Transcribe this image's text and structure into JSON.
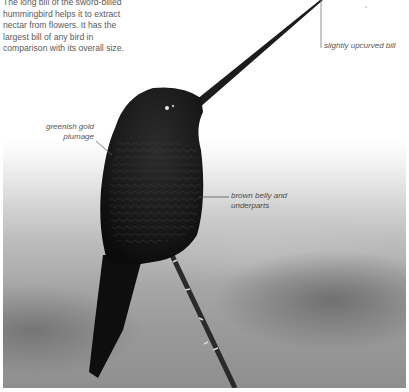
{
  "intro": {
    "text": "The long bill of the sword-billed hummingbird helps it to extract nectar from flowers. It has the largest bill of any bird in comparison with its overall size."
  },
  "callouts": [
    {
      "id": "bill",
      "label": "slightly upcurved bill"
    },
    {
      "id": "plumage",
      "label": "greenish gold plumage"
    },
    {
      "id": "belly",
      "label": "brown belly and underparts"
    }
  ],
  "colors": {
    "text": "#5a5a5a",
    "callout_line": "#777777",
    "bird": "#141414",
    "background_top": "#ffffff",
    "background_bottom": "#8f8f8f"
  }
}
